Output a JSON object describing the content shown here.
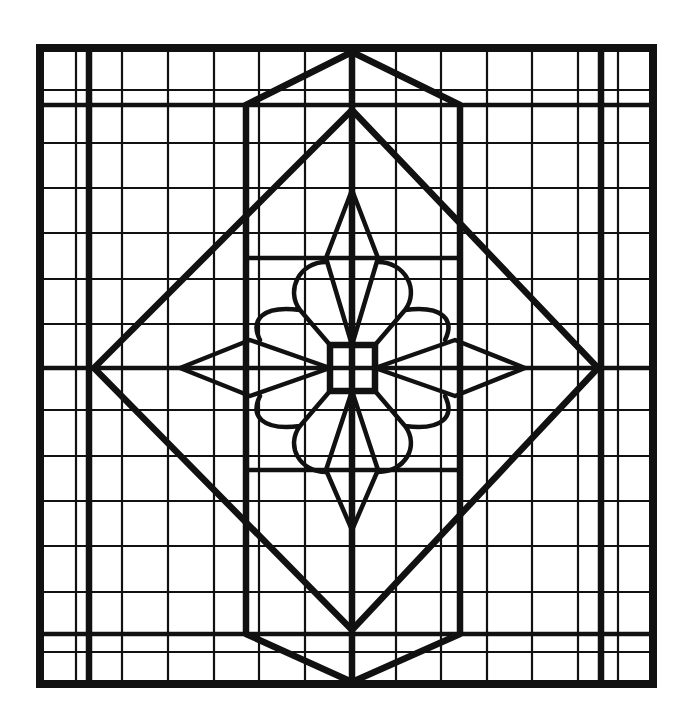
{
  "figure": {
    "title": "",
    "colors": {
      "lead": "#111111",
      "glass": "#ffffff"
    }
  },
  "design": {
    "frame": {
      "x": 40,
      "y": 48,
      "w": 613,
      "h": 636
    },
    "grid_x": [
      76,
      122,
      168,
      214,
      259,
      305,
      396,
      441,
      487,
      532,
      578,
      618
    ],
    "grid_y": [
      90,
      143,
      188,
      233,
      279,
      324,
      410,
      456,
      501,
      546,
      592,
      652
    ],
    "bold_x": [
      89,
      601
    ],
    "bold_y": [
      105,
      368,
      634
    ],
    "center": {
      "x": 352,
      "y": 368
    },
    "center_square": {
      "x": 330,
      "y": 345,
      "size": 45
    }
  }
}
